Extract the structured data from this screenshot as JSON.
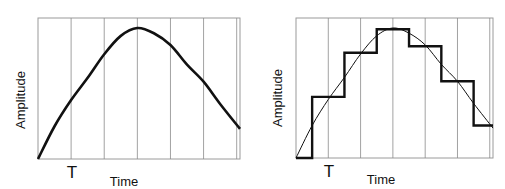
{
  "chart_data": [
    {
      "type": "line",
      "title": "",
      "description": "Continuous analog signal (smooth curve) sampled at interval T",
      "xlabel": "Time",
      "ylabel": "Amplitude",
      "tick_label": "T",
      "grid": "vertical lines at each sampling interval T",
      "x_range": [
        0,
        6.1
      ],
      "y_range": [
        0,
        1
      ],
      "sample_times": [
        1,
        2,
        3,
        4,
        5,
        6
      ],
      "series": [
        {
          "name": "analog signal",
          "x": [
            0,
            0.5,
            1,
            1.5,
            2,
            2.5,
            3,
            3.5,
            4,
            4.5,
            5,
            5.5,
            6.1
          ],
          "y": [
            0,
            0.25,
            0.45,
            0.62,
            0.8,
            0.94,
            1.0,
            0.96,
            0.87,
            0.72,
            0.59,
            0.42,
            0.23
          ]
        }
      ]
    },
    {
      "type": "line",
      "title": "",
      "description": "Same analog signal with its sampled / held (quantized staircase) approximation",
      "xlabel": "Time",
      "ylabel": "Amplitude",
      "tick_label": "T",
      "grid": "vertical lines at each sampling interval T",
      "x_range": [
        0,
        6.1
      ],
      "y_range": [
        0,
        1
      ],
      "sample_times": [
        1,
        2,
        3,
        4,
        5,
        6
      ],
      "series": [
        {
          "name": "analog signal",
          "x": [
            0,
            0.5,
            1,
            1.5,
            2,
            2.5,
            3,
            3.5,
            4,
            4.5,
            5,
            5.5,
            6.1
          ],
          "y": [
            0,
            0.25,
            0.45,
            0.62,
            0.8,
            0.94,
            1.0,
            0.96,
            0.87,
            0.72,
            0.59,
            0.42,
            0.23
          ]
        },
        {
          "name": "staircase approximation",
          "steps": [
            {
              "x0": 0,
              "x1": 0.5,
              "y": 0
            },
            {
              "x0": 0.5,
              "x1": 1.5,
              "y": 0.47
            },
            {
              "x0": 1.5,
              "x1": 2.5,
              "y": 0.81
            },
            {
              "x0": 2.5,
              "x1": 3.5,
              "y": 0.99
            },
            {
              "x0": 3.5,
              "x1": 4.5,
              "y": 0.86
            },
            {
              "x0": 4.5,
              "x1": 5.5,
              "y": 0.59
            },
            {
              "x0": 5.5,
              "x1": 6.1,
              "y": 0.25
            }
          ]
        }
      ]
    }
  ],
  "panels": [
    {
      "frame": {
        "x": 38,
        "y": 18,
        "w": 202,
        "h": 141
      },
      "ylabel_pos": {
        "x": 22,
        "y": 100
      },
      "tick_pos": {
        "x": 72,
        "y": 178
      },
      "xlabel_pos": {
        "x": 124,
        "y": 186
      }
    },
    {
      "frame": {
        "x": 296,
        "y": 18,
        "w": 197,
        "h": 140
      },
      "ylabel_pos": {
        "x": 279,
        "y": 98
      },
      "tick_pos": {
        "x": 329,
        "y": 177
      },
      "xlabel_pos": {
        "x": 381,
        "y": 184
      }
    }
  ],
  "colors": {
    "frame": "#9a9a9a",
    "grid": "#8a8a8a",
    "signal": "#111111",
    "staircase": "#111111",
    "text": "#111111"
  }
}
